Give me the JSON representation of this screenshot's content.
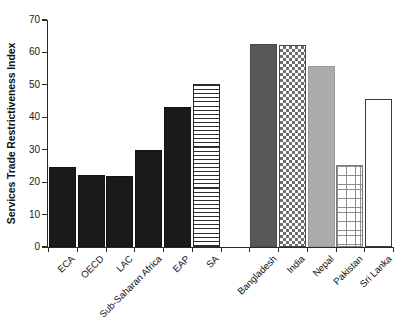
{
  "chart_data": {
    "type": "bar",
    "title": "",
    "subtitle": "",
    "xlabel": "",
    "ylabel": "Services Trade Restrictiveness Index",
    "ylim": [
      0,
      70
    ],
    "yticks": [
      0,
      10,
      20,
      30,
      40,
      50,
      60,
      70
    ],
    "grid": false,
    "legend": "none",
    "categories": [
      "ECA",
      "OECD",
      "LAC",
      "Sub-Saharan Africa",
      "EAP",
      "SA",
      "Bangladesh",
      "India",
      "Nepal",
      "Pakistan",
      "Sri Lanka"
    ],
    "values": [
      24.8,
      22.3,
      22.0,
      29.8,
      43.3,
      50.3,
      62.7,
      62.2,
      55.8,
      25.2,
      45.5
    ],
    "bar_styles": [
      "solid-black",
      "solid-black",
      "solid-black",
      "solid-black",
      "solid-black",
      "hlines",
      "solid-dark",
      "checker",
      "solid-light",
      "grid",
      "open"
    ],
    "groups": [
      {
        "name": "regions",
        "categories": [
          "ECA",
          "OECD",
          "LAC",
          "Sub-Saharan Africa",
          "EAP",
          "SA"
        ]
      },
      {
        "name": "south-asia-countries",
        "categories": [
          "Bangladesh",
          "India",
          "Nepal",
          "Pakistan",
          "Sri Lanka"
        ]
      }
    ],
    "colors": {
      "solid_black": "#1a1a1a",
      "solid_dark_gray": "#585858",
      "solid_light_gray": "#ababab",
      "outline": "#2b2b2b",
      "background": "#ffffff"
    }
  }
}
